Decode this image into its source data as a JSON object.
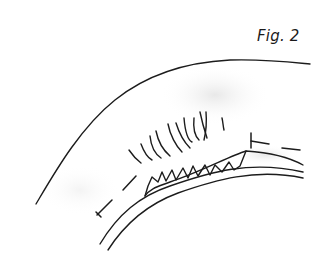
{
  "figure": {
    "label": "Fig. 2",
    "colors": {
      "ink": "#1c1c1c",
      "background": "#ffffff",
      "shading": "#e6e6e6"
    }
  },
  "paths": {
    "outer_surface": "M36,204 C55,172 80,128 115,100 C150,72 190,62 230,60 C265,59 290,62 310,64",
    "inner_surface_upper": "M145,196 C150,188 160,186 170,182 C200,172 230,156 246,151 C262,152 285,155 303,165",
    "inner_surface_lower": "M100,244 C118,214 140,196 170,186 C210,172 250,160 303,172",
    "inner_surface_lowest": "M108,250 C126,222 148,204 178,193 C215,180 255,168 303,178",
    "villi_base": "M145,196 L148,186 L152,177 L158,182 L162,172 L166,181 L172,170 L176,180 L183,168 L188,178 L193,166 L198,176 L205,165 L210,175 L215,165 L222,172 L229,162 L234,170 L240,166 L246,151",
    "crypts": [
      "M129,150 C133,156 137,160 141,163",
      "M141,144 C144,152 148,158 152,160",
      "M150,136 C151,146 155,154 161,158",
      "M156,131 C158,141 163,150 170,156",
      "M168,124 C170,135 176,146 182,152",
      "M176,123 C180,136 186,144 190,148",
      "M184,118 C185,130 188,140 192,142",
      "M194,118 C193,128 195,136 199,140",
      "M200,112 C202,122 205,132 207,138",
      "M206,112 C207,124 206,132 204,140",
      "M222,118 C223,122 223,126 224,130"
    ],
    "dash_left": [
      "M97,215 L112,200",
      "M123,190 L136,176"
    ],
    "tick_left": "M97,215 L100,218 M95,213 L99,217",
    "tick_left_bar": "M96,212 L101,217",
    "dash_right": [
      "M251,141 L269,144",
      "M282,148 L300,150"
    ],
    "tick_right_bar": "M251,133 L251,148"
  }
}
